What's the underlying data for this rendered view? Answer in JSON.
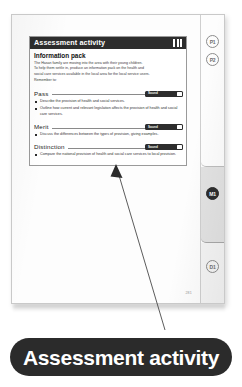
{
  "document": {
    "page_folio": "281"
  },
  "activity_box": {
    "header_title": "Assessment activity",
    "header_decoration": "three-bars",
    "section_title": "Information pack",
    "intro_lines": [
      "The Hasan family are moving into the area with their young children.",
      "To help them settle in, produce an information pack on the health and",
      "social care services available in the local area for the local service users.",
      "Remember to:"
    ],
    "criteria": [
      {
        "label": "Pass",
        "badge_text": "Sound",
        "bullets": [
          "Describe the provision of health and social services.",
          "Outline how current and relevant legislation affects the provision of health and social care services."
        ]
      },
      {
        "label": "Merit",
        "badge_text": "Sound",
        "bullets": [
          "Discuss the differences between the types of provision, giving examples."
        ]
      },
      {
        "label": "Distinction",
        "badge_text": "Sound",
        "bullets": [
          "Compare the national provision of health and social care services to local provision."
        ]
      }
    ]
  },
  "margin_tabs": {
    "grade_pills": [
      {
        "label": "P1",
        "style": "outline"
      },
      {
        "label": "P2",
        "style": "outline"
      },
      {
        "label": "M1",
        "style": "filled"
      },
      {
        "label": "D1",
        "style": "outline"
      }
    ]
  },
  "caption": {
    "text": "Assessment activity"
  },
  "colors": {
    "header_dark": "#2d2d2d",
    "caption_dark": "#2b2b2b",
    "page_white": "#fdfdfd",
    "rule_grey": "#8a8a8a",
    "tab_grey": "#e2e2e2"
  }
}
